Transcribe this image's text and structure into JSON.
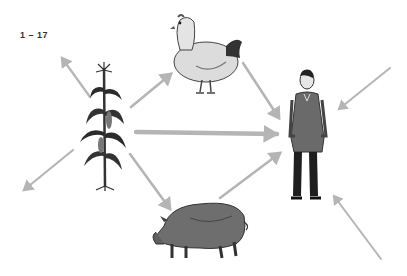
{
  "figure": {
    "label": "1 – 17"
  },
  "nodes": [
    {
      "id": "corn",
      "name": "Corn plant",
      "icon": "corn-plant-icon"
    },
    {
      "id": "chicken",
      "name": "Chicken",
      "icon": "chicken-icon"
    },
    {
      "id": "pig",
      "name": "Pig",
      "icon": "pig-icon"
    },
    {
      "id": "human",
      "name": "Human",
      "icon": "person-icon"
    }
  ],
  "edges": [
    {
      "from": "corn",
      "to": "chicken"
    },
    {
      "from": "corn",
      "to": "human",
      "weight": "thick"
    },
    {
      "from": "corn",
      "to": "pig"
    },
    {
      "from": "chicken",
      "to": "human"
    },
    {
      "from": "pig",
      "to": "human"
    },
    {
      "from": "corn",
      "to": "outside-upper-left"
    },
    {
      "from": "corn",
      "to": "outside-lower-left"
    },
    {
      "from": "outside-upper-right",
      "to": "human"
    },
    {
      "from": "outside-lower-right",
      "to": "human"
    }
  ],
  "colors": {
    "arrow": "#b5b5b5",
    "ink": "#222222",
    "mid": "#6b6b6b"
  }
}
